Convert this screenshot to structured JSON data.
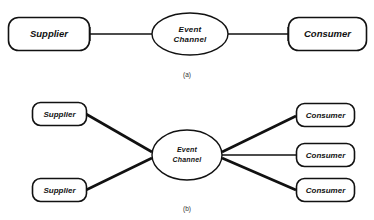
{
  "figure": {
    "stroke_color": "#111111",
    "fill_color": "#ffffff",
    "background": "#ffffff"
  },
  "panel_a": {
    "caption": "(a)",
    "supplier": {
      "label": "Supplier"
    },
    "channel": {
      "line1": "Event",
      "line2": "Channel"
    },
    "consumer": {
      "label": "Consumer"
    }
  },
  "panel_b": {
    "caption": "(b)",
    "channel": {
      "line1": "Event",
      "line2": "Channel"
    },
    "suppliers": [
      {
        "label": "Supplier"
      },
      {
        "label": "Supplier"
      }
    ],
    "consumers": [
      {
        "label": "Consumer"
      },
      {
        "label": "Consumer"
      },
      {
        "label": "Consumer"
      }
    ]
  }
}
